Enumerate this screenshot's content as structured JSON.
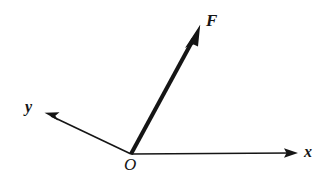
{
  "figure": {
    "kind": "vector-diagram",
    "background_color": "#ffffff",
    "stroke_color": "#151515",
    "width": 322,
    "height": 193
  },
  "labels": {
    "force": "F",
    "x_axis": "x",
    "y_axis": "y",
    "origin": "O"
  },
  "geometry": {
    "origin": {
      "x": 131,
      "y": 154
    },
    "x_axis_tip": {
      "x": 297,
      "y": 153
    },
    "y_axis_tip": {
      "x": 45,
      "y": 113
    },
    "force_tip": {
      "x": 200,
      "y": 25
    },
    "force_stroke_width": 4,
    "axis_stroke_width": 1.6
  }
}
